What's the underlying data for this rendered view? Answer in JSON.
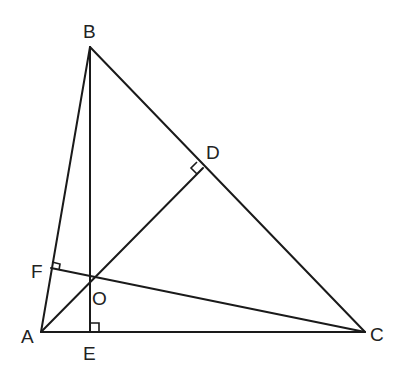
{
  "diagram": {
    "title": "",
    "stroke_color": "#1a1a1a",
    "points": {
      "A": {
        "label": "A",
        "x": 41,
        "y": 332
      },
      "B": {
        "label": "B",
        "x": 90,
        "y": 47
      },
      "C": {
        "label": "C",
        "x": 365,
        "y": 332
      },
      "D": {
        "label": "D",
        "x": 203,
        "y": 168
      },
      "E": {
        "label": "E",
        "x": 90,
        "y": 332
      },
      "F": {
        "label": "F",
        "x": 51,
        "y": 268
      },
      "O": {
        "label": "O",
        "x": 90,
        "y": 282
      }
    },
    "segments": [
      "AB",
      "BC",
      "CA",
      "BE",
      "AD",
      "CF"
    ],
    "right_angles": [
      "D",
      "E",
      "F"
    ]
  }
}
